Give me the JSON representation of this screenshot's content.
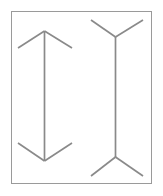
{
  "figure": {
    "canvas": {
      "width": 163,
      "height": 196,
      "background": "#ffffff"
    },
    "frame": {
      "name": "border-frame",
      "x": 11,
      "y": 11,
      "width": 141,
      "height": 173,
      "stroke": "#9a9a9a",
      "stroke_width": 1,
      "fill": "#ffffff"
    },
    "style": {
      "line_color": "#8a8a8a",
      "line_width": 1.7,
      "frame_color": "#9a9a9a"
    },
    "shapes": [
      {
        "id": "left-figure",
        "name": "muller-lyer-arrowheads-in",
        "description": "Vertical shaft with inward-pointing arrowheads at both ends",
        "shaft": {
          "x1": 44.5,
          "y1": 31,
          "x2": 44.5,
          "y2": 161
        },
        "fins": [
          {
            "id": "top-left-fin",
            "x1": 44.5,
            "y1": 31,
            "x2": 18,
            "y2": 48
          },
          {
            "id": "top-right-fin",
            "x1": 44.5,
            "y1": 31,
            "x2": 72,
            "y2": 48
          },
          {
            "id": "bottom-left-fin",
            "x1": 44.5,
            "y1": 161,
            "x2": 18,
            "y2": 143
          },
          {
            "id": "bottom-right-fin",
            "x1": 44.5,
            "y1": 161,
            "x2": 72,
            "y2": 143
          }
        ]
      },
      {
        "id": "right-figure",
        "name": "muller-lyer-arrowheads-out",
        "description": "Vertical shaft with outward-splaying fins at both ends",
        "shaft": {
          "x1": 115.5,
          "y1": 37,
          "x2": 115.5,
          "y2": 157
        },
        "fins": [
          {
            "id": "top-left-fin",
            "x1": 115.5,
            "y1": 37,
            "x2": 91,
            "y2": 20
          },
          {
            "id": "top-right-fin",
            "x1": 115.5,
            "y1": 37,
            "x2": 143,
            "y2": 20
          },
          {
            "id": "bottom-left-fin",
            "x1": 115.5,
            "y1": 157,
            "x2": 91,
            "y2": 176
          },
          {
            "id": "bottom-right-fin",
            "x1": 115.5,
            "y1": 157,
            "x2": 143,
            "y2": 176
          }
        ]
      }
    ]
  }
}
